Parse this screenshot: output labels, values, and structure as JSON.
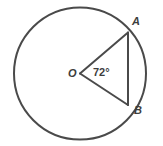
{
  "figure": {
    "name": "circle-with-central-angle",
    "background_color": "#ffffff",
    "stroke_color": "#4a4a4a",
    "shade_color": "#9a9a9a",
    "label_color": "#3d3d3d",
    "circle": {
      "center_x": 80,
      "center_y": 73.5,
      "radius": 66,
      "stroke_width": 2,
      "fill": "#ffffff"
    },
    "center_point": {
      "label": "O",
      "x": 80,
      "y": 73.5
    },
    "points": [
      {
        "label": "A",
        "x": 128,
        "y": 32.5,
        "angle_deg": 39
      },
      {
        "label": "B",
        "x": 128,
        "y": 105.0,
        "angle_deg": -33
      }
    ],
    "central_angle": {
      "value": 72,
      "unit": "degrees",
      "label": "72°",
      "vertex": "O",
      "arms": [
        "A",
        "B"
      ]
    },
    "shaded_region": {
      "type": "circular-segment",
      "between": "chord AB and minor arc AB",
      "fill": "#9a9a9a"
    },
    "radii": [
      {
        "from": "O",
        "to": "A"
      },
      {
        "from": "O",
        "to": "B"
      }
    ],
    "chord": {
      "from": "A",
      "to": "B"
    }
  }
}
